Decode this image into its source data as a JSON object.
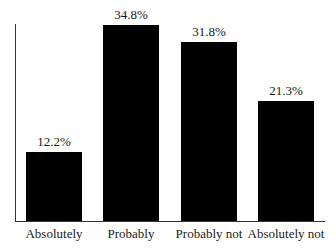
{
  "chart_data": {
    "type": "bar",
    "title": "",
    "xlabel": "",
    "ylabel": "",
    "categories": [
      "Absolutely",
      "Probably",
      "Probably not",
      "Absolutely not"
    ],
    "values": [
      12.2,
      34.8,
      31.8,
      21.3
    ],
    "value_labels": [
      "12.2%",
      "34.8%",
      "31.8%",
      "21.3%"
    ],
    "unit": "%",
    "ylim": [
      0,
      35
    ],
    "grid": false,
    "legend": null,
    "bar_color": "#000000"
  }
}
